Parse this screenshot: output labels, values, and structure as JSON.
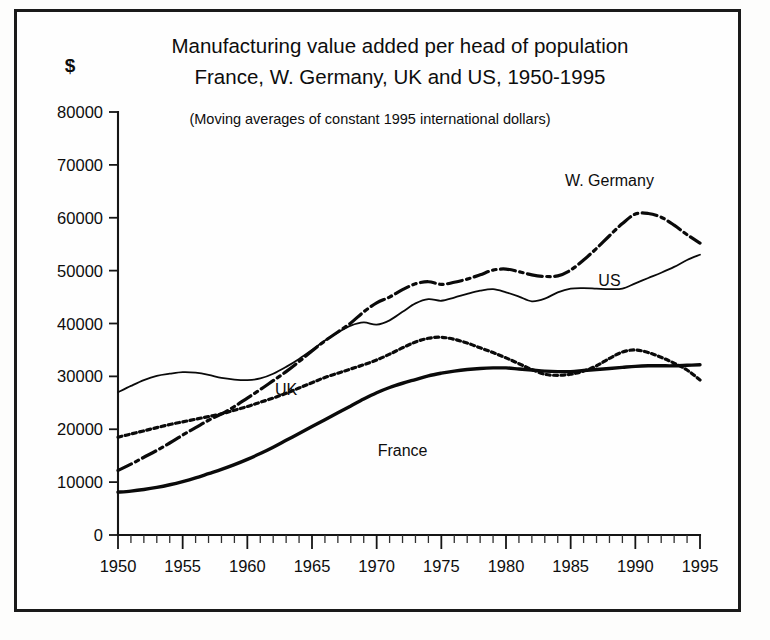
{
  "figure": {
    "unit_label": "$",
    "title_line1": "Manufacturing value added per head of population",
    "title_line2": "France, W. Germany, UK and US, 1950-1995",
    "note": "(Moving averages of constant 1995 international dollars)"
  },
  "chart_data": {
    "type": "line",
    "title": "Manufacturing value added per head of population France, W. Germany, UK and US, 1950-1995",
    "subtitle": "(Moving averages of constant 1995 international dollars)",
    "xlabel": "",
    "ylabel": "$",
    "xlim": [
      1950,
      1995
    ],
    "ylim": [
      0,
      80000
    ],
    "ytick_step": 10000,
    "xtick_step": 5,
    "xminor_step": 1,
    "grid": false,
    "legend": "inline-labels",
    "ytick_labels": [
      "0",
      "10000",
      "20000",
      "30000",
      "40000",
      "50000",
      "60000",
      "70000",
      "80000"
    ],
    "xtick_labels": [
      "1950",
      "1955",
      "1960",
      "1965",
      "1970",
      "1975",
      "1980",
      "1985",
      "1990",
      "1995"
    ],
    "x": [
      1950,
      1951,
      1952,
      1953,
      1954,
      1955,
      1956,
      1957,
      1958,
      1959,
      1960,
      1961,
      1962,
      1963,
      1964,
      1965,
      1966,
      1967,
      1968,
      1969,
      1970,
      1971,
      1972,
      1973,
      1974,
      1975,
      1976,
      1977,
      1978,
      1979,
      1980,
      1981,
      1982,
      1983,
      1984,
      1985,
      1986,
      1987,
      1988,
      1989,
      1990,
      1991,
      1992,
      1993,
      1994,
      1995
    ],
    "series": [
      {
        "name": "US",
        "style": "solid-thin",
        "label_x": 1988,
        "label_y": 47000,
        "values": [
          27000,
          28200,
          29300,
          30100,
          30500,
          30800,
          30700,
          30300,
          29700,
          29400,
          29300,
          29600,
          30500,
          31800,
          33300,
          35000,
          36800,
          38300,
          39600,
          40200,
          39800,
          40600,
          42200,
          43800,
          44600,
          44300,
          44900,
          45600,
          46200,
          46500,
          45900,
          45100,
          44200,
          44700,
          45900,
          46600,
          46700,
          46600,
          46500,
          46600,
          47600,
          48600,
          49600,
          50700,
          52000,
          53000
        ]
      },
      {
        "name": "W. Germany",
        "style": "dash-dot",
        "label_x": 1988,
        "label_y": 66000,
        "values": [
          12200,
          13400,
          14700,
          16000,
          17400,
          18900,
          20300,
          21700,
          22900,
          24300,
          25900,
          27500,
          29200,
          30900,
          32800,
          34800,
          36700,
          38400,
          40100,
          42200,
          43900,
          45000,
          46400,
          47500,
          47900,
          47400,
          47800,
          48400,
          49200,
          50100,
          50300,
          49800,
          49200,
          48900,
          49000,
          50100,
          52000,
          54200,
          56600,
          58900,
          60700,
          60800,
          60100,
          58600,
          56800,
          55200
        ]
      },
      {
        "name": "UK",
        "style": "dotted",
        "label_x": 1963,
        "label_y": 26500,
        "values": [
          18500,
          19100,
          19700,
          20300,
          20900,
          21400,
          21900,
          22400,
          22900,
          23600,
          24300,
          25100,
          25900,
          26800,
          27800,
          28800,
          29800,
          30600,
          31400,
          32200,
          33100,
          34200,
          35400,
          36500,
          37200,
          37400,
          37000,
          36300,
          35400,
          34500,
          33500,
          32400,
          31300,
          30400,
          30200,
          30400,
          31000,
          32000,
          33400,
          34600,
          35000,
          34500,
          33600,
          32500,
          31200,
          29300
        ]
      },
      {
        "name": "France",
        "style": "solid-thick",
        "label_x": 1972,
        "label_y": 15000,
        "values": [
          8100,
          8300,
          8600,
          9000,
          9500,
          10100,
          10800,
          11600,
          12400,
          13300,
          14300,
          15400,
          16600,
          17900,
          19200,
          20500,
          21800,
          23100,
          24400,
          25700,
          26900,
          27900,
          28700,
          29400,
          30100,
          30600,
          31000,
          31300,
          31500,
          31600,
          31600,
          31400,
          31200,
          31000,
          30900,
          30900,
          31100,
          31300,
          31500,
          31700,
          31900,
          32000,
          32000,
          32000,
          32100,
          32200
        ]
      }
    ]
  }
}
